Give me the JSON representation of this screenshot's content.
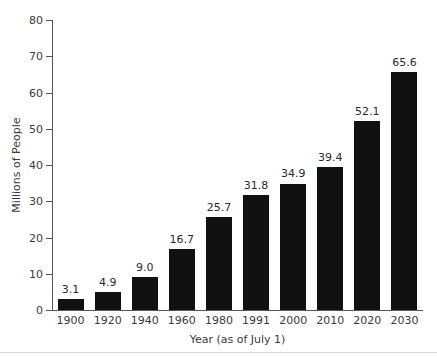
{
  "chart_data": {
    "type": "bar",
    "title": "",
    "xlabel": "Year (as of July 1)",
    "ylabel": "Millions of People",
    "categories": [
      "1900",
      "1920",
      "1940",
      "1960",
      "1980",
      "1991",
      "2000",
      "2010",
      "2020",
      "2030"
    ],
    "values": [
      3.1,
      4.9,
      9.0,
      16.7,
      25.7,
      31.8,
      34.9,
      39.4,
      52.1,
      65.6
    ],
    "value_labels": [
      "3.1",
      "4.9",
      "9.0",
      "16.7",
      "25.7",
      "31.8",
      "34.9",
      "39.4",
      "52.1",
      "65.6"
    ],
    "ylim": [
      0,
      80
    ],
    "yticks": [
      0,
      10,
      20,
      30,
      40,
      50,
      60,
      70,
      80
    ],
    "ytick_labels": [
      "0",
      "10",
      "20",
      "30",
      "40",
      "50",
      "60",
      "70",
      "80"
    ],
    "grid": false,
    "legend": null,
    "bar_color": "#111111",
    "axis_color": "#555555",
    "background_color": "#ffffff"
  }
}
